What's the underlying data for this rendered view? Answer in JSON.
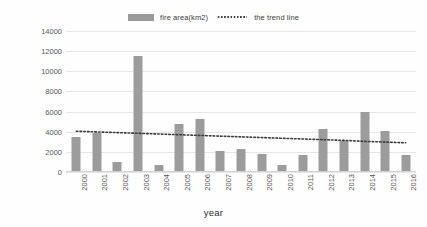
{
  "chart_data": {
    "type": "bar",
    "title": "",
    "xlabel": "year",
    "ylabel": "fire area（km2）",
    "ylim": [
      0,
      14000
    ],
    "ytick_step": 2000,
    "yticks": [
      "14000",
      "12000",
      "10000",
      "8000",
      "6000",
      "4000",
      "2000",
      "0"
    ],
    "grid": true,
    "legend_position": "top-center",
    "categories": [
      "2000",
      "2001",
      "2002",
      "2003",
      "2004",
      "2005",
      "2006",
      "2007",
      "2008",
      "2009",
      "2010",
      "2011",
      "2012",
      "2013",
      "2014",
      "2015",
      "2016"
    ],
    "series": [
      {
        "name": "fire area(km2)",
        "type": "bar",
        "color": "#9c9c9c",
        "values": [
          3500,
          3900,
          1000,
          11500,
          650,
          4800,
          5300,
          2050,
          2300,
          1750,
          700,
          1650,
          4300,
          3050,
          6000,
          4050,
          1700
        ]
      },
      {
        "name": "the trend line",
        "type": "line",
        "style": "dotted",
        "color": "#3b3b3b",
        "values": [
          4050,
          3980,
          3910,
          3840,
          3770,
          3700,
          3630,
          3560,
          3490,
          3420,
          3350,
          3280,
          3210,
          3140,
          3040,
          2970,
          2900
        ]
      }
    ]
  },
  "legend": {
    "bar_label": "fire area(km2)",
    "line_label": "the trend line"
  },
  "axes": {
    "y_title": "fire area（km2）",
    "x_title": "year"
  }
}
